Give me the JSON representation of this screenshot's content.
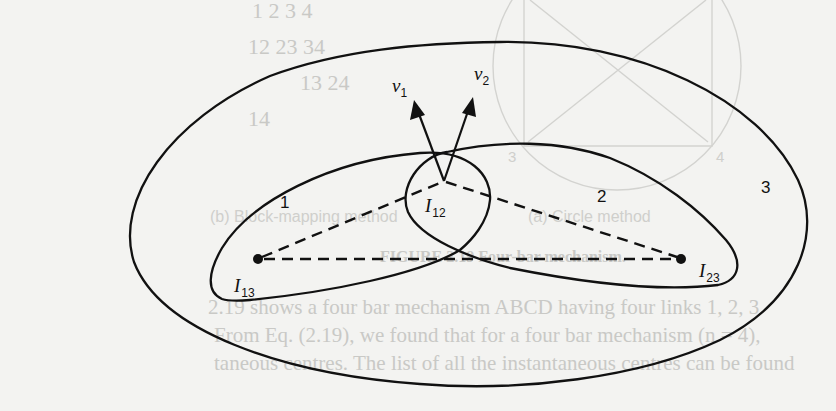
{
  "figure": {
    "colors": {
      "ink": "#111111",
      "paper": "#f3f3f1",
      "ghost": "#c9c9c6"
    },
    "regions": [
      {
        "id": "1",
        "label": "1",
        "x": 286,
        "y": 204
      },
      {
        "id": "2",
        "label": "2",
        "x": 603,
        "y": 198
      },
      {
        "id": "3",
        "label": "3",
        "x": 766,
        "y": 190
      }
    ],
    "points": [
      {
        "id": "I12",
        "main": "I",
        "sub": "12",
        "x": 444,
        "y": 181,
        "label_x": 423,
        "label_y": 212,
        "dot": false
      },
      {
        "id": "I13",
        "main": "I",
        "sub": "13",
        "x": 258,
        "y": 259,
        "label_x": 234,
        "label_y": 292,
        "dot": true
      },
      {
        "id": "I23",
        "main": "I",
        "sub": "23",
        "x": 681,
        "y": 259,
        "label_x": 698,
        "label_y": 277,
        "dot": true
      }
    ],
    "velocity_vectors": [
      {
        "id": "v1",
        "main": "v",
        "sub": "1",
        "tip_x": 414,
        "tip_y": 101,
        "label_x": 397,
        "label_y": 92
      },
      {
        "id": "v2",
        "main": "v",
        "sub": "2",
        "tip_x": 473,
        "tip_y": 97,
        "label_x": 476,
        "label_y": 80
      }
    ]
  },
  "ghost_text": {
    "table_rows": [
      "1   2   3   4",
      "12  23  34",
      "13  24",
      "14"
    ],
    "captions": [
      "(a) Circle method",
      "(b) Block-mapping method"
    ],
    "figure_caption": "FIGURE 2.19 Four-bar mechanism.",
    "body_lines": [
      "2.19 shows a four bar mechanism ABCD having four links 1, 2, 3",
      "From Eq. (2.19), we found that for a four bar mechanism (n = 4),",
      "taneous centres. The list of all the instantaneous centres can be found"
    ],
    "circle_labels": [
      "3",
      "4"
    ]
  }
}
